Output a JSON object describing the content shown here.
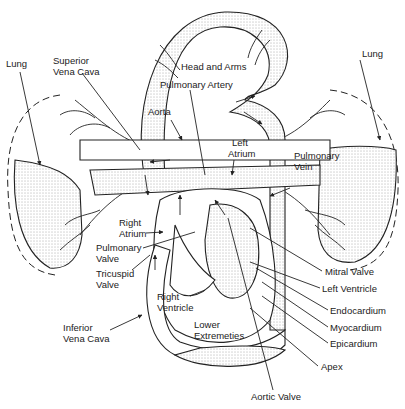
{
  "figure": {
    "type": "circulatory-system-diagram",
    "colors": {
      "ink": "#222222",
      "background": "#ffffff",
      "stipple": "#555555"
    }
  },
  "labels": {
    "lung_left": "Lung",
    "lung_right": "Lung",
    "superior_vena_cava_1": "Superior",
    "superior_vena_cava_2": "Vena Cava",
    "head_and_arms": "Head and Arms",
    "pulmonary_artery": "Pulmonary Artery",
    "aorta": "Aorta",
    "left_atrium_1": "Left",
    "left_atrium_2": "Atrium",
    "pulmonary_vein_1": "Pulmonary",
    "pulmonary_vein_2": "Vein",
    "right_atrium_1": "Right",
    "right_atrium_2": "Atrium",
    "pulmonary_valve_1": "Pulmonary",
    "pulmonary_valve_2": "Valve",
    "tricuspid_valve_1": "Tricuspid",
    "tricuspid_valve_2": "Valve",
    "right_ventricle_1": "Right",
    "right_ventricle_2": "Ventricle",
    "inferior_vena_cava_1": "Inferior",
    "inferior_vena_cava_2": "Vena Cava",
    "lower_extremeties_1": "Lower",
    "lower_extremeties_2": "Extremeties",
    "mitral_valve": "Mitral Valve",
    "left_ventricle": "Left Ventricle",
    "endocardium": "Endocardium",
    "myocardium": "Myocardium",
    "epicardium": "Epicardium",
    "apex": "Apex",
    "aortic_valve": "Aortic Valve"
  }
}
